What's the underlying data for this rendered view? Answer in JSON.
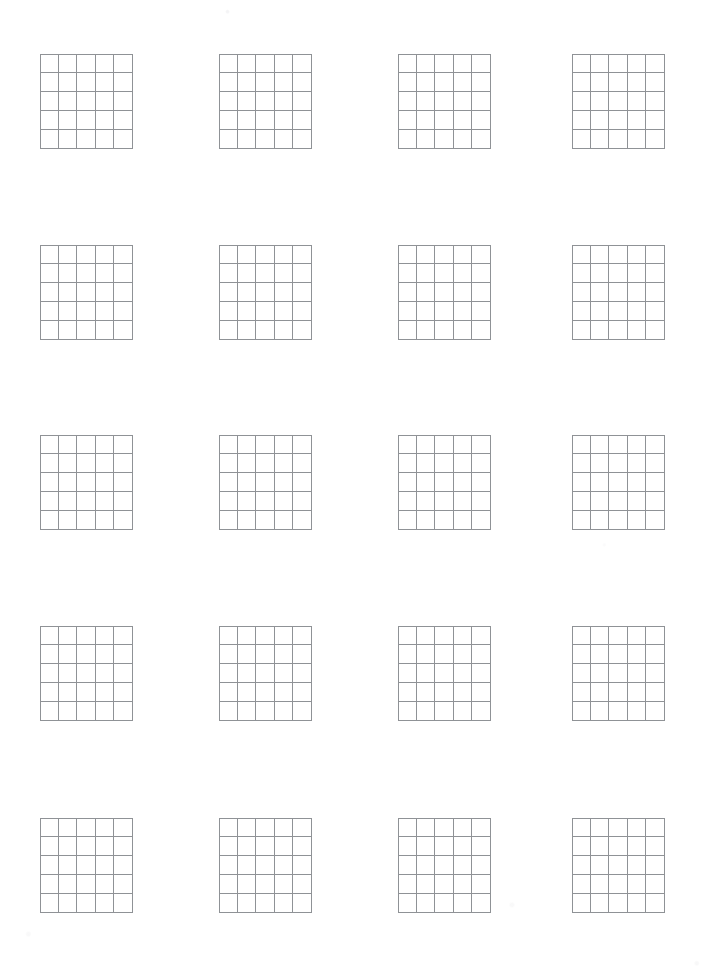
{
  "document": {
    "kind": "worksheet-page",
    "title": "Blank 5x5 Grid Worksheet",
    "paper_color": "#ffffff",
    "line_color": "#8f9296",
    "width_px": 711,
    "height_px": 973,
    "text_content": "",
    "grid_count": 20,
    "rows": 5,
    "columns": 4
  },
  "grid_spec": {
    "cells_across": 5,
    "cells_down": 5,
    "cell_width_px": 18.6,
    "cell_height_px": 19,
    "grid_width_px": 93,
    "grid_height_px": 95,
    "line_width_px": 1,
    "fill": "#ffffff"
  },
  "layout": {
    "column_left_px": [
      40,
      219,
      398,
      572
    ],
    "row_top_px": [
      54,
      245,
      435,
      626,
      818
    ]
  },
  "grids": [
    {
      "id": "grid-r1-c1",
      "row": 1,
      "col": 1,
      "label": ""
    },
    {
      "id": "grid-r1-c2",
      "row": 1,
      "col": 2,
      "label": ""
    },
    {
      "id": "grid-r1-c3",
      "row": 1,
      "col": 3,
      "label": ""
    },
    {
      "id": "grid-r1-c4",
      "row": 1,
      "col": 4,
      "label": ""
    },
    {
      "id": "grid-r2-c1",
      "row": 2,
      "col": 1,
      "label": ""
    },
    {
      "id": "grid-r2-c2",
      "row": 2,
      "col": 2,
      "label": ""
    },
    {
      "id": "grid-r2-c3",
      "row": 2,
      "col": 3,
      "label": ""
    },
    {
      "id": "grid-r2-c4",
      "row": 2,
      "col": 4,
      "label": ""
    },
    {
      "id": "grid-r3-c1",
      "row": 3,
      "col": 1,
      "label": ""
    },
    {
      "id": "grid-r3-c2",
      "row": 3,
      "col": 2,
      "label": ""
    },
    {
      "id": "grid-r3-c3",
      "row": 3,
      "col": 3,
      "label": ""
    },
    {
      "id": "grid-r3-c4",
      "row": 3,
      "col": 4,
      "label": ""
    },
    {
      "id": "grid-r4-c1",
      "row": 4,
      "col": 1,
      "label": ""
    },
    {
      "id": "grid-r4-c2",
      "row": 4,
      "col": 2,
      "label": ""
    },
    {
      "id": "grid-r4-c3",
      "row": 4,
      "col": 3,
      "label": ""
    },
    {
      "id": "grid-r4-c4",
      "row": 4,
      "col": 4,
      "label": ""
    },
    {
      "id": "grid-r5-c1",
      "row": 5,
      "col": 1,
      "label": ""
    },
    {
      "id": "grid-r5-c2",
      "row": 5,
      "col": 2,
      "label": ""
    },
    {
      "id": "grid-r5-c3",
      "row": 5,
      "col": 3,
      "label": ""
    },
    {
      "id": "grid-r5-c4",
      "row": 5,
      "col": 4,
      "label": ""
    }
  ]
}
